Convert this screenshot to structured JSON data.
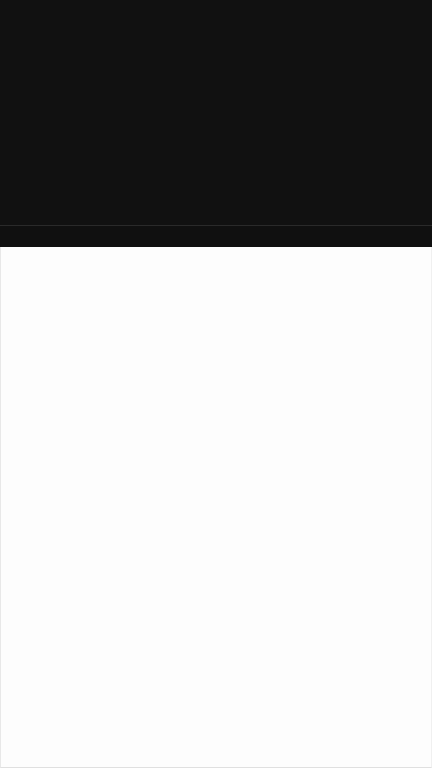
{
  "screen": {
    "state": "blank",
    "colors": {
      "top_region": "#111111",
      "divider": "#2a2a2a",
      "content_background": "#fdfdfd"
    }
  }
}
